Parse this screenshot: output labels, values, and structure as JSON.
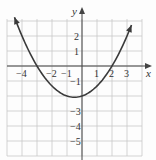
{
  "chart_data": {
    "type": "line",
    "title": "",
    "xlabel": "x",
    "ylabel": "y",
    "xlim": [
      -5,
      4
    ],
    "ylim": [
      -6,
      3
    ],
    "grid": true,
    "x_ticks": [
      -4,
      -2,
      -1,
      1,
      2,
      3
    ],
    "x_tick_labels": [
      "−4",
      "−2",
      "−1",
      "1",
      "2",
      "3"
    ],
    "y_ticks": [
      2,
      1,
      -1,
      -3,
      -4,
      -5
    ],
    "y_tick_labels": [
      "2",
      "1",
      "−1",
      "−3",
      "−4",
      "−5"
    ],
    "series": [
      {
        "name": "parabola",
        "equation": "y = (x^2 + x - 6) / 3",
        "x_intercepts": [
          -3,
          2
        ],
        "vertex": [
          -0.5,
          -2.08
        ],
        "x": [
          -4.5,
          -4,
          -3,
          -2,
          -1,
          -0.5,
          0,
          1,
          2,
          3,
          3.3
        ],
        "values": [
          3.25,
          2.0,
          0.0,
          -1.33,
          -2.0,
          -2.08,
          -2.0,
          -1.33,
          0.0,
          2.0,
          2.73
        ],
        "arrows_both_ends": true,
        "color": "#3a3a3a"
      }
    ]
  },
  "axis_labels": {
    "x": "x",
    "y": "y"
  }
}
